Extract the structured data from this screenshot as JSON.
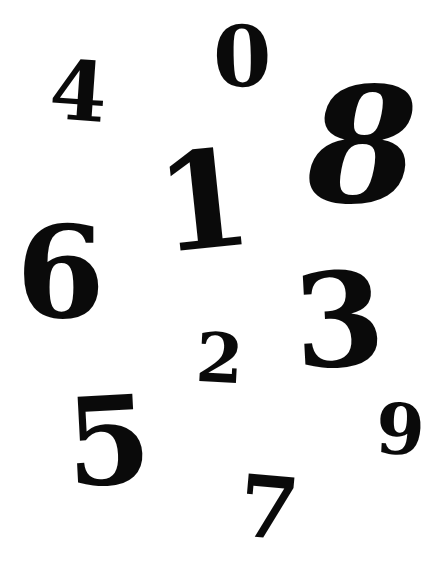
{
  "digits": [
    {
      "value": "4",
      "left": 50,
      "top": 50,
      "size": 82,
      "rotate": 4,
      "italic": false
    },
    {
      "value": "0",
      "left": 213,
      "top": 15,
      "size": 84,
      "rotate": -1,
      "italic": false
    },
    {
      "value": "8",
      "left": 307,
      "top": 66,
      "size": 160,
      "rotate": 0,
      "italic": true
    },
    {
      "value": "1",
      "left": 157,
      "top": 134,
      "size": 134,
      "rotate": -6,
      "italic": false
    },
    {
      "value": "6",
      "left": 16,
      "top": 208,
      "size": 128,
      "rotate": 0,
      "italic": false
    },
    {
      "value": "3",
      "left": 294,
      "top": 256,
      "size": 130,
      "rotate": -3,
      "italic": false
    },
    {
      "value": "2",
      "left": 196,
      "top": 324,
      "size": 68,
      "rotate": 3,
      "italic": false
    },
    {
      "value": "5",
      "left": 66,
      "top": 380,
      "size": 122,
      "rotate": -3,
      "italic": false
    },
    {
      "value": "9",
      "left": 376,
      "top": 395,
      "size": 70,
      "rotate": 3,
      "italic": false
    },
    {
      "value": "7",
      "left": 239,
      "top": 465,
      "size": 86,
      "rotate": 5,
      "italic": false
    }
  ],
  "colors": {
    "background": "#ffffff",
    "digit": "#0a0a0a"
  }
}
